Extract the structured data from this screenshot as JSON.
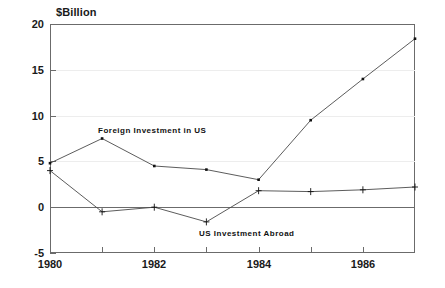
{
  "chart_data": {
    "type": "line",
    "title": "",
    "ylabel": "$Billion",
    "xlabel": "",
    "ylim": [
      -5,
      20
    ],
    "xlim": [
      1980,
      1987
    ],
    "grid": "horizontal-dotted",
    "legend_position": "inline-annotations",
    "y_ticks": [
      20,
      15,
      10,
      5,
      0,
      -5
    ],
    "y_tick_labels": [
      "20",
      "15",
      "10",
      "5",
      "0",
      "-5"
    ],
    "x_ticks": [
      1980,
      1981,
      1982,
      1983,
      1984,
      1985,
      1986,
      1987
    ],
    "x_tick_labels": [
      "1980",
      "",
      "1982",
      "",
      "1984",
      "",
      "1986",
      ""
    ],
    "x_labeled": [
      "1980",
      "1982",
      "1984",
      "1986"
    ],
    "categories": [
      1980,
      1981,
      1982,
      1983,
      1984,
      1985,
      1986,
      1987
    ],
    "series": [
      {
        "name": "Foreign Investment in US",
        "values": [
          4.8,
          7.5,
          4.5,
          4.1,
          3.0,
          9.5,
          14.0,
          18.4
        ],
        "color": "#4a4a4a",
        "marker": "square"
      },
      {
        "name": "US Investment Abroad",
        "values": [
          4.0,
          -0.5,
          0.0,
          -1.6,
          1.8,
          1.7,
          1.9,
          2.2
        ],
        "color": "#4a4a4a",
        "marker": "plus"
      }
    ],
    "annotations": [
      {
        "text": "Foreign Investment in US",
        "near_x": 1982,
        "near_y": 6.2
      },
      {
        "text": "US Investment Abroad",
        "near_x": 1983.8,
        "near_y": -2.8
      }
    ]
  },
  "colors": {
    "axis": "#6b6b6b",
    "grid": "#ededed",
    "line": "#4a4a4a",
    "text": "#1a1a1a",
    "background": "#ffffff"
  }
}
